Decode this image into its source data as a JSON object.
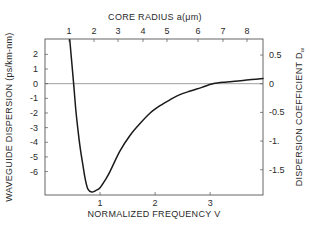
{
  "chart_data": {
    "type": "line",
    "title": "",
    "xlabel": "NORMALIZED FREQUENCY V",
    "ylabel": "WAVEGUIDE DISPERSION (ps/km-nm)",
    "x2label": "CORE RADIUS a(μm)",
    "y2label": "DISPERSION COEFFICIENT D",
    "y2label_sub": "w",
    "xlim": [
      0,
      3.96
    ],
    "ylim": [
      -7.6,
      3.05
    ],
    "y2lim": [
      -1.94,
      0.78
    ],
    "grid": false,
    "legend": "none",
    "x_ticks": [
      {
        "value": 1,
        "label": "1"
      },
      {
        "value": 2,
        "label": "2"
      },
      {
        "value": 3,
        "label": "3"
      }
    ],
    "y_ticks": [
      {
        "value": 2,
        "label": "2"
      },
      {
        "value": 1,
        "label": "1"
      },
      {
        "value": 0,
        "label": "0"
      },
      {
        "value": -1,
        "label": "-1"
      },
      {
        "value": -2,
        "label": "-2"
      },
      {
        "value": -3,
        "label": "-3"
      },
      {
        "value": -4,
        "label": "-4"
      },
      {
        "value": -5,
        "label": "-5"
      },
      {
        "value": -6,
        "label": "-6"
      }
    ],
    "y2_ticks": [
      {
        "value": 0.5,
        "label": "0.5"
      },
      {
        "value": 0,
        "label": "0"
      },
      {
        "value": -0.5,
        "label": "-0.5"
      },
      {
        "value": -1,
        "label": "-1."
      },
      {
        "value": -1.5,
        "label": "-1.5"
      }
    ],
    "x2_ticks": [
      {
        "px": 69,
        "label": "1"
      },
      {
        "px": 94,
        "label": "2"
      },
      {
        "px": 118,
        "label": "3"
      },
      {
        "px": 143,
        "label": "4"
      },
      {
        "px": 167,
        "label": "5"
      },
      {
        "px": 198,
        "label": "6"
      },
      {
        "px": 223,
        "label": "7"
      },
      {
        "px": 247,
        "label": "8"
      }
    ],
    "reference_line": {
      "y": 0,
      "label": "zero dispersion"
    },
    "series": [
      {
        "name": "Waveguide dispersion",
        "x": [
          0.45,
          0.52,
          0.56,
          0.6,
          0.64,
          0.69,
          0.73,
          0.78,
          0.85,
          0.92,
          1.0,
          1.09,
          1.18,
          1.36,
          1.55,
          1.73,
          1.91,
          2.09,
          2.27,
          2.45,
          2.64,
          2.85,
          3.05,
          3.3,
          3.55,
          3.75,
          3.96
        ],
        "values": [
          3.0,
          0.0,
          -1.8,
          -3.2,
          -4.4,
          -5.6,
          -6.5,
          -7.2,
          -7.4,
          -7.3,
          -7.1,
          -6.6,
          -6.0,
          -4.6,
          -3.5,
          -2.7,
          -2.0,
          -1.5,
          -1.1,
          -0.75,
          -0.5,
          -0.25,
          0.0,
          0.12,
          0.2,
          0.28,
          0.35
        ]
      }
    ]
  }
}
